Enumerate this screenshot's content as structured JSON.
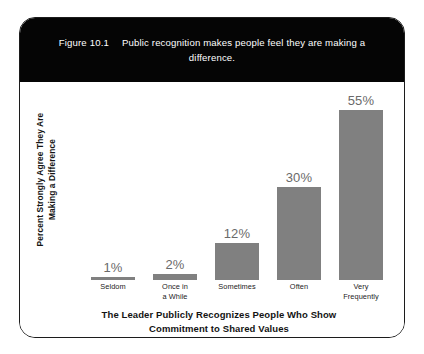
{
  "figure": {
    "number": "Figure 10.1",
    "caption": "Public recognition makes people feel they are making a difference.",
    "header_bg": "#050505",
    "header_text_color": "#ffffff",
    "card_border_color": "#1c1c1c",
    "card_bg": "#ffffff"
  },
  "chart_data": {
    "type": "bar",
    "categories": [
      "Seldom",
      "Once in a While",
      "Sometimes",
      "Often",
      "Very Frequently"
    ],
    "values": [
      1,
      2,
      12,
      30,
      55
    ],
    "data_labels": [
      "1%",
      "2%",
      "12%",
      "30%",
      "55%"
    ],
    "xlabel": "The Leader Publicly Recognizes People Who Show Commitment to Shared Values",
    "ylabel": "Percent Strongly Agree They Are Making a Difference",
    "ylim": [
      0,
      62
    ],
    "grid": false,
    "legend": "none",
    "bar_color": "#808080",
    "label_color": "#6a6a6a"
  },
  "axes": {
    "y_title_line1": "Percent Strongly Agree They Are",
    "y_title_line2": "Making a Difference",
    "x_title_line1": "The Leader Publicly Recognizes People Who Show",
    "x_title_line2": "Commitment to Shared Values"
  },
  "categories_display": [
    {
      "line1": "Seldom",
      "line2": ""
    },
    {
      "line1": "Once in",
      "line2": "a While"
    },
    {
      "line1": "Sometimes",
      "line2": ""
    },
    {
      "line1": "Often",
      "line2": ""
    },
    {
      "line1": "Very",
      "line2": "Frequently"
    }
  ]
}
